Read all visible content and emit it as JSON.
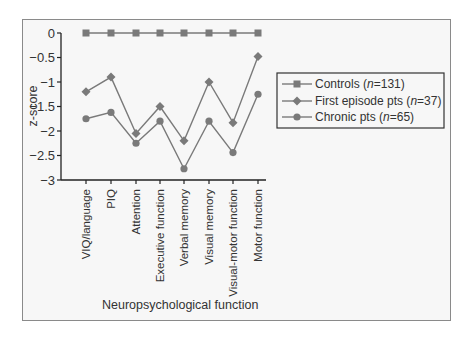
{
  "chart_data": {
    "type": "line",
    "title": "",
    "xlabel": "Neuropsychological function",
    "ylabel": "z-score",
    "ylim": [
      -3,
      0
    ],
    "yticks": [
      0,
      -0.5,
      -1,
      -1.5,
      -2,
      -2.5,
      -3
    ],
    "ytick_labels": [
      "0",
      "−0.5",
      "−1",
      "−1.5",
      "−2",
      "−2.5",
      "−3"
    ],
    "grid": false,
    "legend_position": "right",
    "categories": [
      "VIQ/language",
      "PIQ",
      "Attention",
      "Executive function",
      "Verbal memory",
      "Visual memory",
      "Visual-motor function",
      "Motor function"
    ],
    "series": [
      {
        "name": "Controls (n=131)",
        "label_main": "Controls (",
        "label_n": "n",
        "label_rest": "=131)",
        "marker": "square",
        "values": [
          0,
          0,
          0,
          0,
          0,
          0,
          0,
          0
        ]
      },
      {
        "name": "First episode pts (n=37)",
        "label_main": "First episode pts (",
        "label_n": "n",
        "label_rest": "=37)",
        "marker": "diamond",
        "values": [
          -1.2,
          -0.9,
          -2.05,
          -1.5,
          -2.2,
          -1.0,
          -1.83,
          -0.48
        ]
      },
      {
        "name": "Chronic pts (n=65)",
        "label_main": "Chronic pts (",
        "label_n": "n",
        "label_rest": "=65)",
        "marker": "circle",
        "values": [
          -1.75,
          -1.62,
          -2.25,
          -1.8,
          -2.77,
          -1.8,
          -2.44,
          -1.25
        ]
      }
    ]
  },
  "colors": {
    "line": "#7a7a7a",
    "marker": "#7a7a7a",
    "axis": "#222222",
    "frame": "#8a8a8a"
  }
}
